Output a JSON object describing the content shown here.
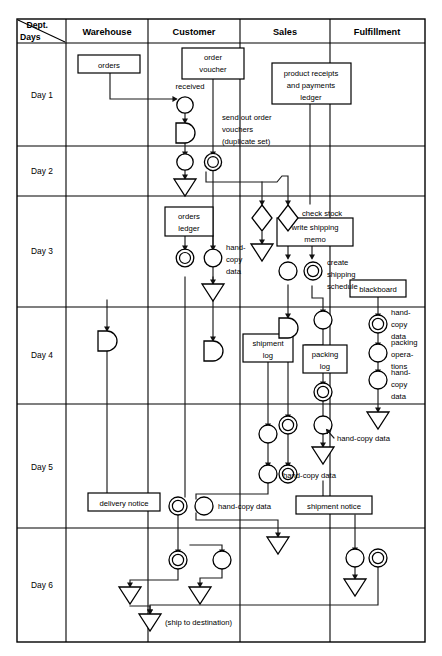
{
  "diagram": {
    "corner_header": {
      "dept_label": "Dept.",
      "days_label": "Days"
    },
    "columns": [
      {
        "id": "warehouse",
        "label": "Warehouse"
      },
      {
        "id": "customer",
        "label": "Customer"
      },
      {
        "id": "sales",
        "label": "Sales"
      },
      {
        "id": "fulfillment",
        "label": "Fulfillment"
      }
    ],
    "rows": [
      {
        "id": "day1",
        "label": "Day 1"
      },
      {
        "id": "day2",
        "label": "Day 2"
      },
      {
        "id": "day3",
        "label": "Day 3"
      },
      {
        "id": "day4",
        "label": "Day 4"
      },
      {
        "id": "day5",
        "label": "Day 5"
      },
      {
        "id": "day6",
        "label": "Day 6"
      }
    ],
    "documents": [
      {
        "id": "orders",
        "text": "orders",
        "column": "warehouse",
        "row": "day1"
      },
      {
        "id": "order-voucher",
        "text": "order voucher",
        "column": "customer",
        "row": "day1"
      },
      {
        "id": "product-receipts-ledger",
        "text": "product receipts and payments ledger",
        "column": "sales",
        "row": "day1"
      },
      {
        "id": "orders-ledger",
        "text": "orders ledger",
        "column": "customer",
        "row": "day3"
      },
      {
        "id": "write-shipping-memo",
        "text": "write shipping memo",
        "column": "sales",
        "row": "day3"
      },
      {
        "id": "blackboard",
        "text": "blackboard",
        "column": "fulfillment",
        "row": "day3"
      },
      {
        "id": "shipment-log",
        "text": "shipment log",
        "column": "sales",
        "row": "day4"
      },
      {
        "id": "packing-log",
        "text": "packing log",
        "column": "sales",
        "row": "day4"
      },
      {
        "id": "shipment-notice",
        "text": "shipment notice",
        "column": "sales",
        "row": "day5"
      },
      {
        "id": "delivery-notice",
        "text": "delivery notice",
        "column": "warehouse",
        "row": "day5"
      }
    ],
    "annotations": [
      {
        "id": "received",
        "text": "received",
        "column": "customer",
        "row": "day1"
      },
      {
        "id": "send-out-order-vouchers",
        "text": "send out order vouchers (duplicate set)",
        "column": "customer",
        "row": "day1"
      },
      {
        "id": "hand-copy-data-day3",
        "text": "hand-copy data",
        "column": "customer",
        "row": "day3"
      },
      {
        "id": "check-stock",
        "text": "check stock",
        "column": "sales",
        "row": "day3"
      },
      {
        "id": "create-shipping-schedule",
        "text": "create shipping schedule",
        "column": "sales",
        "row": "day3"
      },
      {
        "id": "hand-copy-data-fulfil-1",
        "text": "hand-copy data",
        "column": "fulfillment",
        "row": "day4"
      },
      {
        "id": "packing-operations",
        "text": "packing operations",
        "column": "fulfillment",
        "row": "day4"
      },
      {
        "id": "hand-copy-data-fulfil-2",
        "text": "hand-copy data",
        "column": "fulfillment",
        "row": "day4"
      },
      {
        "id": "hand-copy-data-day5-a",
        "text": "hand-copy data",
        "column": "sales",
        "row": "day5"
      },
      {
        "id": "hand-copy-data-day5-b",
        "text": "hand-copy data",
        "column": "sales",
        "row": "day5"
      },
      {
        "id": "hand-copy-data-day5-c",
        "text": "hand-copy data",
        "column": "customer",
        "row": "day5"
      },
      {
        "id": "ship-to-destination",
        "text": "(ship to destination)",
        "column": "customer",
        "row": "day6"
      }
    ],
    "node_legend": [
      {
        "shape": "circle",
        "meaning": "place"
      },
      {
        "shape": "double-circle",
        "meaning": "place with record/ledger write"
      },
      {
        "shape": "diamond",
        "meaning": "decision"
      },
      {
        "shape": "triangle-down",
        "meaning": "terminator / sink"
      },
      {
        "shape": "half-round",
        "meaning": "delay / wait"
      }
    ],
    "colors": {
      "stroke": "#000000",
      "background": "#ffffff",
      "flow": "#1a1a1a"
    }
  }
}
